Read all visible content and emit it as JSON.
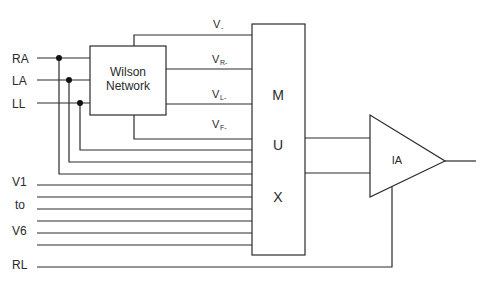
{
  "diagram": {
    "inputs": {
      "ra": "RA",
      "la": "LA",
      "ll": "LL",
      "v1": "V1",
      "to": "to",
      "v6": "V6",
      "rl": "RL"
    },
    "wilson": {
      "line1": "Wilson",
      "line2": "Network"
    },
    "signals": {
      "vminus": {
        "base": "V",
        "sub": "-"
      },
      "vr": {
        "base": "V",
        "sub": "R-"
      },
      "vl": {
        "base": "V",
        "sub": "L-"
      },
      "vf": {
        "base": "V",
        "sub": "F-"
      }
    },
    "mux": {
      "m": "M",
      "u": "U",
      "x": "X"
    },
    "amp": {
      "label": "IA"
    },
    "colors": {
      "line": "#2b2b2b",
      "text": "#2a2a2a",
      "background": "#ffffff"
    }
  }
}
